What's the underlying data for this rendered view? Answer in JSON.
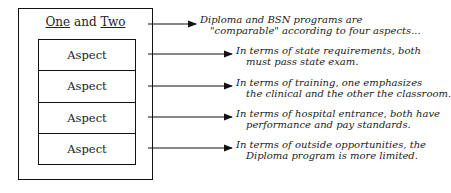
{
  "diagram": {
    "box_title": {
      "part1": "One",
      "part2": " and ",
      "part3": "Two"
    },
    "aspects": [
      "Aspect",
      "Aspect",
      "Aspect",
      "Aspect"
    ],
    "notes": [
      {
        "line1": "Diploma and BSN programs are",
        "line2": "\"comparable\" according to four aspects..."
      },
      {
        "line1": "In terms of state requirements, both",
        "line2": "must pass   state exam."
      },
      {
        "line1": "In terms of training, one emphasizes",
        "line2": "the clinical and the other the classroom."
      },
      {
        "line1": "In terms of hospital entrance, both have",
        "line2": "performance and pay standards."
      },
      {
        "line1": "In terms of outside opportunities, the",
        "line2": "Diploma program is more limited."
      }
    ]
  }
}
